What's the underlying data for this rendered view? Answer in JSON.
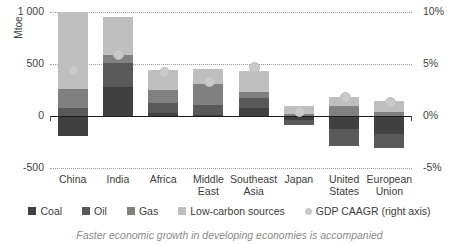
{
  "chart_data": {
    "type": "bar",
    "title": "",
    "subtitle": "",
    "xlabel": "",
    "ylabel": "Mtoe",
    "y2label": "",
    "ylim": [
      -500,
      1000
    ],
    "y2lim": [
      -5,
      10
    ],
    "yticks": [
      "-500",
      "0",
      "500",
      "1 000"
    ],
    "y2ticks": [
      "-5%",
      "0%",
      "5%",
      "10%"
    ],
    "grid": true,
    "legend_position": "bottom",
    "stacked": true,
    "categories": [
      "China",
      "India",
      "Africa",
      "Middle East",
      "Southeast Asia",
      "Japan",
      "United States",
      "European Union"
    ],
    "category_lines": [
      [
        "China",
        ""
      ],
      [
        "India",
        ""
      ],
      [
        "Africa",
        ""
      ],
      [
        "Middle",
        "East"
      ],
      [
        "Southeast",
        "Asia"
      ],
      [
        "Japan",
        ""
      ],
      [
        "United",
        "States"
      ],
      [
        "European",
        "Union"
      ]
    ],
    "series": [
      {
        "name": "Coal",
        "color": "#404040",
        "values": [
          -190,
          275,
          30,
          5,
          75,
          -35,
          -125,
          -175
        ]
      },
      {
        "name": "Oil",
        "color": "#595959",
        "values": [
          80,
          235,
          95,
          105,
          95,
          -50,
          -160,
          -130
        ]
      },
      {
        "name": "Gas",
        "color": "#808080",
        "values": [
          175,
          80,
          125,
          195,
          60,
          20,
          95,
          40
        ]
      },
      {
        "name": "Low-carbon sources",
        "color": "#bfbfbf",
        "values": [
          745,
          360,
          190,
          145,
          205,
          75,
          85,
          100
        ]
      }
    ],
    "scatter_series": {
      "name": "GDP CAAGR (right axis)",
      "color": "#c9c9c9",
      "axis": "right",
      "unit": "%",
      "values": [
        4.5,
        6.0,
        4.3,
        3.4,
        4.8,
        0.5,
        1.9,
        1.4
      ]
    }
  },
  "legend": {
    "items": [
      {
        "label": "Coal",
        "color": "#404040",
        "shape": "square"
      },
      {
        "label": "Oil",
        "color": "#595959",
        "shape": "square"
      },
      {
        "label": "Gas",
        "color": "#808080",
        "shape": "square"
      },
      {
        "label": "Low-carbon sources",
        "color": "#bfbfbf",
        "shape": "square"
      },
      {
        "label": "GDP CAAGR (right axis)",
        "color": "#c9c9c9",
        "shape": "circle"
      }
    ]
  },
  "caption": {
    "text": "Faster economic growth in developing economies is accompanied"
  }
}
